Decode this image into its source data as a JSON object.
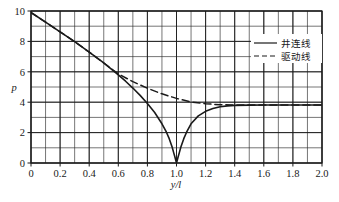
{
  "chart_data": {
    "type": "line",
    "title": "",
    "xlabel": "y/l",
    "ylabel": "p",
    "xlim": [
      0,
      2.0
    ],
    "ylim": [
      0,
      10
    ],
    "grid": true,
    "xticks": [
      "0",
      "0.2",
      "0.4",
      "0.6",
      "0.8",
      "1.0",
      "1.2",
      "1.4",
      "1.6",
      "1.8",
      "2.0"
    ],
    "xtick_values": [
      0,
      0.2,
      0.4,
      0.6,
      0.8,
      1.0,
      1.2,
      1.4,
      1.6,
      1.8,
      2.0
    ],
    "yticks": [
      "0",
      "2",
      "4",
      "6",
      "8",
      "10"
    ],
    "ytick_values": [
      0,
      2,
      4,
      6,
      8,
      10
    ],
    "minor_x_step": 0.1,
    "minor_y_step": 1,
    "legend_position": "upper-right",
    "series": [
      {
        "name": "井连线",
        "style": "solid",
        "color": "#1a1a1a",
        "x": [
          0.0,
          0.1,
          0.2,
          0.3,
          0.4,
          0.5,
          0.6,
          0.65,
          0.7,
          0.75,
          0.8,
          0.85,
          0.9,
          0.93,
          0.95,
          0.97,
          0.98,
          0.99,
          1.0,
          1.01,
          1.02,
          1.03,
          1.05,
          1.07,
          1.1,
          1.15,
          1.2,
          1.25,
          1.3,
          1.35,
          1.4,
          1.5,
          1.6,
          1.7,
          1.8,
          1.9,
          2.0
        ],
        "y": [
          9.9,
          9.27,
          8.63,
          7.98,
          7.3,
          6.58,
          5.8,
          5.38,
          4.93,
          4.45,
          3.92,
          3.32,
          2.58,
          2.04,
          1.6,
          1.05,
          0.7,
          0.36,
          0.0,
          0.36,
          0.7,
          1.05,
          1.6,
          2.04,
          2.58,
          3.1,
          3.4,
          3.58,
          3.7,
          3.76,
          3.79,
          3.81,
          3.82,
          3.82,
          3.82,
          3.82,
          3.82
        ]
      },
      {
        "name": "驱动线",
        "style": "dashed",
        "color": "#1a1a1a",
        "x": [
          0.0,
          0.1,
          0.2,
          0.3,
          0.4,
          0.5,
          0.6,
          0.7,
          0.8,
          0.9,
          1.0,
          1.1,
          1.2,
          1.3,
          1.4,
          1.5,
          1.6,
          1.7,
          1.8,
          1.9,
          2.0
        ],
        "y": [
          9.9,
          9.27,
          8.63,
          7.98,
          7.3,
          6.58,
          5.86,
          5.35,
          4.92,
          4.55,
          4.25,
          4.02,
          3.9,
          3.83,
          3.82,
          3.82,
          3.82,
          3.82,
          3.82,
          3.82,
          3.82
        ]
      }
    ],
    "asymptote": 3.82,
    "cusp_x": 1.0
  },
  "legend": {
    "entries": [
      {
        "label": "井连线",
        "style": "solid"
      },
      {
        "label": "驱动线",
        "style": "dashed"
      }
    ]
  }
}
